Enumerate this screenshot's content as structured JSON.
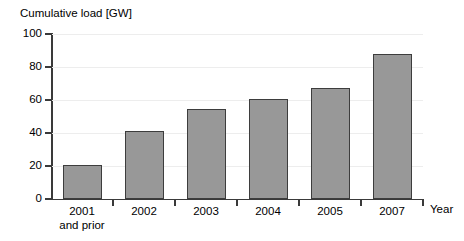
{
  "chart_data": {
    "type": "bar",
    "title": "Cumulative load [GW]",
    "xlabel": "Year",
    "ylabel": "Cumulative load [GW]",
    "categories": [
      "2001 and prior",
      "2002",
      "2003",
      "2004",
      "2005",
      "2007"
    ],
    "category_labels": [
      {
        "line1": "2001",
        "line2": "and prior"
      },
      {
        "line1": "2002",
        "line2": ""
      },
      {
        "line1": "2003",
        "line2": ""
      },
      {
        "line1": "2004",
        "line2": ""
      },
      {
        "line1": "2005",
        "line2": ""
      },
      {
        "line1": "2007",
        "line2": ""
      }
    ],
    "values": [
      20.5,
      41,
      54.5,
      60.5,
      67,
      88
    ],
    "ylim": [
      0,
      100
    ],
    "yticks": [
      0,
      20,
      40,
      60,
      80,
      100
    ],
    "ytick_labels": [
      "0",
      "20",
      "40",
      "60",
      "80",
      "100"
    ],
    "grid": true,
    "legend": "none",
    "bar_color": "#989898",
    "bar_border_color": "#3d3d3d",
    "axis_color": "#3a3a3a",
    "gridline_color": "#ededed",
    "background": "#ffffff"
  }
}
